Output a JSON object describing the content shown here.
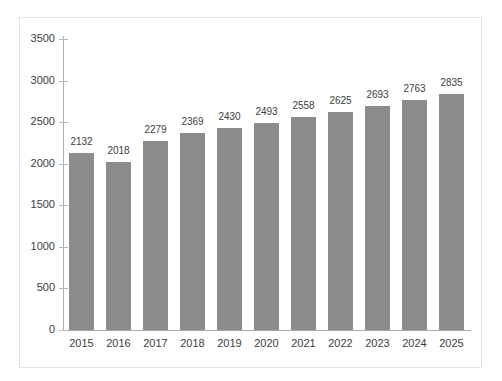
{
  "chart_data": {
    "type": "bar",
    "title": "",
    "subtitle": "",
    "xlabel": "",
    "ylabel": "",
    "categories": [
      "2015",
      "2016",
      "2017",
      "2018",
      "2019",
      "2020",
      "2021",
      "2022",
      "2023",
      "2024",
      "2025"
    ],
    "values": [
      2132,
      2018,
      2279,
      2369,
      2430,
      2493,
      2558,
      2625,
      2693,
      2763,
      2835
    ],
    "data_labels": [
      "2132",
      "2018",
      "2279",
      "2369",
      "2430",
      "2493",
      "2558",
      "2625",
      "2693",
      "2763",
      "2835"
    ],
    "ylim": [
      0,
      3500
    ],
    "y_ticks": [
      0,
      500,
      1000,
      1500,
      2000,
      2500,
      3000,
      3500
    ],
    "y_tick_labels": [
      "0",
      "500",
      "1000",
      "1500",
      "2000",
      "2500",
      "3000",
      "3500"
    ],
    "grid": false,
    "legend": null,
    "legend_position": "none",
    "series": [
      {
        "name": "",
        "values": [
          2132,
          2018,
          2279,
          2369,
          2430,
          2493,
          2558,
          2625,
          2693,
          2763,
          2835
        ]
      }
    ],
    "colors": {
      "bar_fill": "#8c8c8c",
      "axis_line": "#aaaaaa",
      "tick_mark": "#b8b8b8",
      "text": "#3d3d3d",
      "frame_border": "#e3e3e3",
      "background": "#ffffff"
    }
  }
}
